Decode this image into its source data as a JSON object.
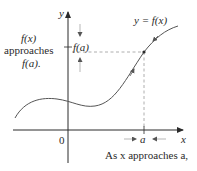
{
  "diagram": {
    "axes": {
      "y_label": "y",
      "x_label": "x",
      "origin_label": "0"
    },
    "curve_label": "y = f(x)",
    "left_annotation": {
      "line1": "f(x)",
      "line2": "approaches",
      "line3": "f(a)."
    },
    "fa_tick_label": "f(a)",
    "a_tick_label": "a",
    "bottom_annotation": "As x approaches a,",
    "colors": {
      "axis": "#2a2a2a",
      "curve": "#555555",
      "dashed": "#9a9a9a",
      "text": "#2a2a2a"
    }
  }
}
